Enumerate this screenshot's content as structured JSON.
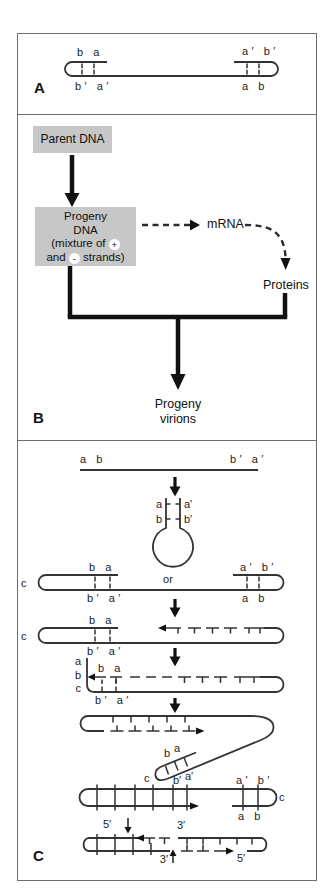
{
  "colors": {
    "line": "#333333",
    "box_fill": "#c7c7c7",
    "panel_border": "#6e6e6e",
    "background": "#ffffff"
  },
  "panelA": {
    "letter": "A",
    "top_left": "b a",
    "bottom_left": "b′ a′",
    "top_right": "a′ b′",
    "bottom_right": "a b"
  },
  "panelB": {
    "letter": "B",
    "parent_box": "Parent DNA",
    "progeny_line1": "Progeny",
    "progeny_line2": "DNA",
    "progeny_line3_pre": "(mixture of",
    "plus": "+",
    "progeny_line4_pre": "and",
    "minus": "-",
    "progeny_line4_post": "strands)",
    "mrna": "mRNA",
    "proteins": "Proteins",
    "virions_line1": "Progeny",
    "virions_line2": "virions"
  },
  "panelC": {
    "letter": "C",
    "step1": {
      "left": "a b",
      "right": "b′ a′"
    },
    "step2": {
      "a": "a",
      "b": "b",
      "a_prime": "a′",
      "b_prime": "b′"
    },
    "or": "or",
    "step3": {
      "top_left": "b a",
      "bottom_left": "b′ a′",
      "top_right": "a′ b′",
      "bottom_right": "a b",
      "c": "c"
    },
    "step4": {
      "top_left": "b a",
      "bottom_left": "b′ a′",
      "c": "c"
    },
    "step5": {
      "side_a": "a",
      "side_b": "b",
      "side_c": "c",
      "top": "b a",
      "bottom": "b′ a′"
    },
    "step6": {
      "hp_b": "b",
      "hp_a": "a",
      "hp_b_prime": "b′",
      "hp_a_prime": "a′",
      "c": "c"
    },
    "step7": {
      "top_right": "a′ b′",
      "bottom_right": "a b",
      "c": "c"
    },
    "step8": {
      "top_5": "5′",
      "top_3": "3′",
      "bottom_3": "3′",
      "bottom_5": "5′"
    }
  }
}
